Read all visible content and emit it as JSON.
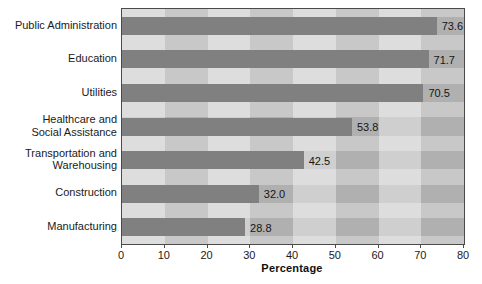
{
  "chart_data": {
    "type": "bar",
    "orientation": "horizontal",
    "title": "",
    "xlabel": "Percentage",
    "ylabel": "",
    "xlim": [
      0,
      80
    ],
    "xticks": [
      0,
      10,
      20,
      30,
      40,
      50,
      60,
      70,
      80
    ],
    "xtick_labels": [
      "0",
      "10",
      "20",
      "30",
      "40",
      "50",
      "60",
      "70",
      "80"
    ],
    "grid": false,
    "legend": null,
    "categories": [
      "Public Administration",
      "Education",
      "Utilities",
      "Healthcare and\nSocial Assistance",
      "Transportation and\nWarehousing",
      "Construction",
      "Manufacturing"
    ],
    "values": [
      73.6,
      71.7,
      70.5,
      53.8,
      42.5,
      32.0,
      28.8
    ],
    "data_labels": [
      "73.6",
      "71.7",
      "70.5",
      "53.8",
      "42.5",
      "32.0",
      "28.8"
    ],
    "colors": {
      "bar": "#808080",
      "plot_background_light": "#cfcfcf",
      "plot_background_medium": "#b0b0b0",
      "axis_line": "#4a4a4a",
      "text": "#1a1a1a",
      "page_background": "#ffffff"
    }
  }
}
